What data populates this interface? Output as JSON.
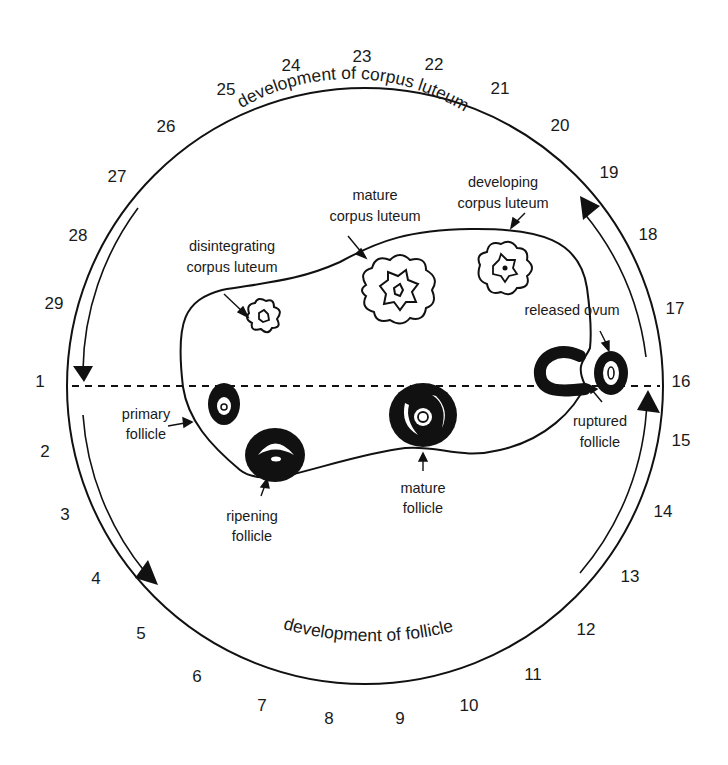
{
  "diagram": {
    "day_numbers": [
      {
        "day": "1",
        "x": 40,
        "y": 387
      },
      {
        "day": "2",
        "x": 45,
        "y": 457
      },
      {
        "day": "3",
        "x": 65,
        "y": 520
      },
      {
        "day": "4",
        "x": 96,
        "y": 584
      },
      {
        "day": "5",
        "x": 141,
        "y": 639
      },
      {
        "day": "6",
        "x": 197,
        "y": 682
      },
      {
        "day": "7",
        "x": 262,
        "y": 711
      },
      {
        "day": "8",
        "x": 329,
        "y": 724
      },
      {
        "day": "9",
        "x": 400,
        "y": 724
      },
      {
        "day": "10",
        "x": 469,
        "y": 711
      },
      {
        "day": "11",
        "x": 533,
        "y": 680
      },
      {
        "day": "12",
        "x": 586,
        "y": 635
      },
      {
        "day": "13",
        "x": 630,
        "y": 582
      },
      {
        "day": "14",
        "x": 663,
        "y": 517
      },
      {
        "day": "15",
        "x": 681,
        "y": 446
      },
      {
        "day": "16",
        "x": 681,
        "y": 387
      },
      {
        "day": "17",
        "x": 675,
        "y": 314
      },
      {
        "day": "18",
        "x": 648,
        "y": 240
      },
      {
        "day": "19",
        "x": 609,
        "y": 178
      },
      {
        "day": "20",
        "x": 560,
        "y": 131
      },
      {
        "day": "21",
        "x": 500,
        "y": 94
      },
      {
        "day": "22",
        "x": 434,
        "y": 70
      },
      {
        "day": "23",
        "x": 362,
        "y": 62
      },
      {
        "day": "24",
        "x": 291,
        "y": 71
      },
      {
        "day": "25",
        "x": 226,
        "y": 95
      },
      {
        "day": "26",
        "x": 166,
        "y": 132
      },
      {
        "day": "27",
        "x": 117,
        "y": 182
      },
      {
        "day": "28",
        "x": 78,
        "y": 241
      },
      {
        "day": "29",
        "x": 54,
        "y": 309
      }
    ],
    "arc_labels": {
      "top": "development of corpus luteum",
      "bottom": "development of follicle"
    },
    "structures": {
      "disintegrating_corpus_luteum": [
        "disintegrating",
        "corpus luteum"
      ],
      "mature_corpus_luteum": [
        "mature",
        "corpus luteum"
      ],
      "developing_corpus_luteum": [
        "developing",
        "corpus luteum"
      ],
      "released_ovum": [
        "released ovum"
      ],
      "ruptured_follicle": [
        "ruptured",
        "follicle"
      ],
      "primary_follicle": [
        "primary",
        "follicle"
      ],
      "ripening_follicle": [
        "ripening",
        "follicle"
      ],
      "mature_follicle": [
        "mature",
        "follicle"
      ]
    },
    "colors": {
      "ink": "#111111",
      "background": "#ffffff"
    }
  }
}
